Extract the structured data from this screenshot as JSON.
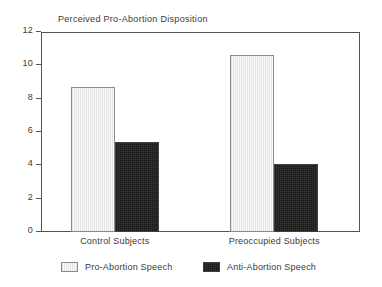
{
  "chart_data": {
    "type": "bar",
    "title": "Perceived Pro-Abortion Disposition",
    "xlabel": "",
    "ylabel": "",
    "categories": [
      "Control Subjects",
      "Preoccupied Subjects"
    ],
    "series": [
      {
        "name": "Pro-Abortion Speech",
        "values": [
          8.7,
          10.6
        ],
        "fill": "light-vertical-hatch",
        "color": "#eeeeee"
      },
      {
        "name": "Anti-Abortion Speech",
        "values": [
          5.4,
          4.1
        ],
        "fill": "dark-crosshatch",
        "color": "#8d8d8d"
      }
    ],
    "ylim": [
      0,
      12
    ],
    "yticks": [
      0,
      2,
      4,
      6,
      8,
      10,
      12
    ],
    "ytick_labels": [
      "0",
      "2",
      "4",
      "6",
      "8",
      "10",
      "12"
    ],
    "grid": false,
    "legend_position": "bottom",
    "frame": true,
    "axis_color": "#555555",
    "text_color": "#3a3a3a"
  },
  "legend": {
    "items": [
      {
        "label": "Pro-Abortion Speech"
      },
      {
        "label": "Anti-Abortion Speech"
      }
    ]
  }
}
